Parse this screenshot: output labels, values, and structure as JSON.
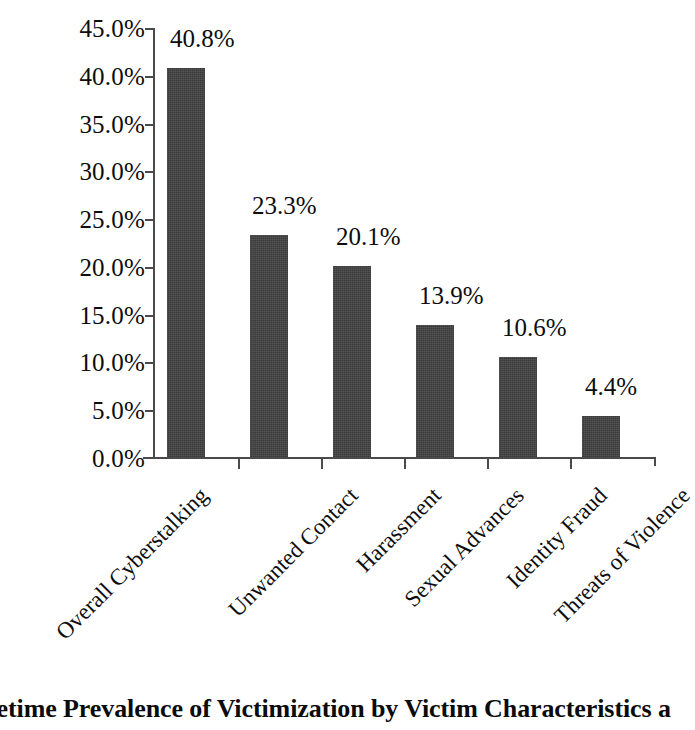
{
  "chart_data": {
    "type": "bar",
    "title": "",
    "xlabel": "",
    "ylabel": "",
    "ylim": [
      0,
      45
    ],
    "grid": false,
    "legend": false,
    "orientation": "vertical",
    "bar_color": "#3b3b3b",
    "categories": [
      "Overall Cyberstalking",
      "Unwanted Contact",
      "Harassment",
      "Sexual Advances",
      "Identity Fraud",
      "Threats of Violence"
    ],
    "values": [
      40.8,
      23.3,
      20.1,
      13.9,
      10.6,
      4.4
    ],
    "value_labels": [
      "40.8%",
      "23.3%",
      "20.1%",
      "13.9%",
      "10.6%",
      "4.4%"
    ],
    "ytick_values": [
      45.0,
      40.0,
      35.0,
      30.0,
      25.0,
      20.0,
      15.0,
      10.0,
      5.0,
      0.0
    ],
    "ytick_labels": [
      "45.0%",
      "40.0%",
      "35.0%",
      "30.0%",
      "25.0%",
      "20.0%",
      "15.0%",
      "10.0%",
      "5.0%",
      "0.0%"
    ]
  },
  "caption": {
    "text": "fetime Prevalence of Victimization by Victim Characteristics a"
  },
  "colors": {
    "bar": "#3b3b3b",
    "axis": "#4a4a4a",
    "text": "#0d0d0d",
    "background": "#ffffff"
  }
}
